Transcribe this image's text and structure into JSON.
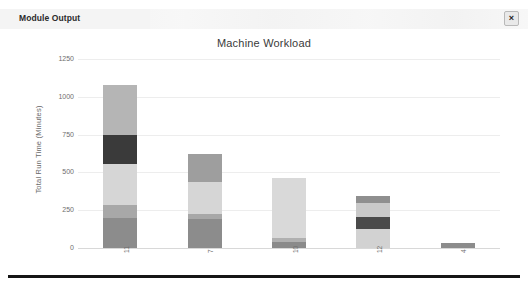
{
  "window": {
    "title": "Module Output",
    "close_label": "×",
    "close_icon": "close-icon"
  },
  "chart_data": {
    "type": "bar",
    "subtype": "stacked-bar",
    "title": "Machine Workload",
    "xlabel": "",
    "ylabel": "Total Run Time (Minutes)",
    "ylim": [
      0,
      1250
    ],
    "yticks": [
      0,
      250,
      500,
      750,
      1000,
      1250
    ],
    "ytick_labels": [
      "0",
      "250",
      "500",
      "750",
      "1000",
      "1250"
    ],
    "grid": true,
    "legend": "none",
    "categories": [
      "11",
      "7",
      "10",
      "12",
      "4"
    ],
    "totals": [
      1080,
      620,
      465,
      345,
      30
    ],
    "series": [
      {
        "name": "segment-1",
        "color": "#8c8c8c",
        "values": [
          200,
          190,
          55,
          125,
          30
        ]
      },
      {
        "name": "segment-2",
        "color": "#a8a8a8",
        "values": [
          85,
          35,
          0,
          0,
          0
        ]
      },
      {
        "name": "segment-3",
        "color": "#d6d6d6",
        "values": [
          270,
          210,
          410,
          95,
          0
        ]
      },
      {
        "name": "segment-4",
        "color": "#3a3a3a",
        "values": [
          190,
          0,
          0,
          80,
          0
        ]
      },
      {
        "name": "segment-5",
        "color": "#b5b5b5",
        "values": [
          335,
          185,
          0,
          45,
          0
        ]
      }
    ],
    "bars": [
      {
        "category": "11",
        "total": 1080,
        "segments": [
          {
            "value": 200,
            "color": "#8c8c8c"
          },
          {
            "value": 85,
            "color": "#a8a8a8"
          },
          {
            "value": 270,
            "color": "#d6d6d6"
          },
          {
            "value": 190,
            "color": "#3a3a3a"
          },
          {
            "value": 335,
            "color": "#b5b5b5"
          }
        ]
      },
      {
        "category": "7",
        "total": 620,
        "segments": [
          {
            "value": 190,
            "color": "#8c8c8c"
          },
          {
            "value": 35,
            "color": "#a8a8a8"
          },
          {
            "value": 210,
            "color": "#d6d6d6"
          },
          {
            "value": 185,
            "color": "#9e9e9e"
          }
        ]
      },
      {
        "category": "10",
        "total": 465,
        "segments": [
          {
            "value": 40,
            "color": "#8a8a8a"
          },
          {
            "value": 25,
            "color": "#b0b0b0"
          },
          {
            "value": 400,
            "color": "#d9d9d9"
          }
        ]
      },
      {
        "category": "12",
        "total": 345,
        "segments": [
          {
            "value": 125,
            "color": "#d2d2d2"
          },
          {
            "value": 80,
            "color": "#4a4a4a"
          },
          {
            "value": 95,
            "color": "#c9c9c9"
          },
          {
            "value": 45,
            "color": "#8f8f8f"
          }
        ]
      },
      {
        "category": "4",
        "total": 30,
        "segments": [
          {
            "value": 30,
            "color": "#8c8c8c"
          }
        ]
      }
    ]
  }
}
